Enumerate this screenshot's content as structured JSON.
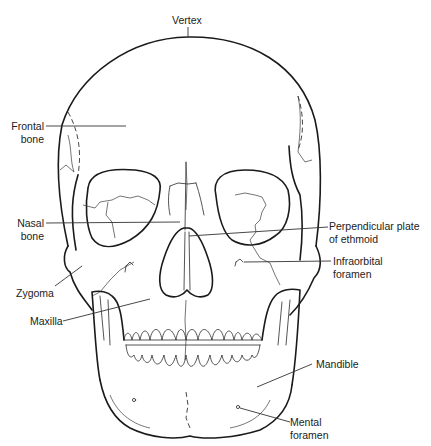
{
  "diagram": {
    "labels": {
      "vertex": {
        "line1": "Vertex"
      },
      "frontal_bone": {
        "line1": "Frontal",
        "line2": "bone"
      },
      "nasal_bone": {
        "line1": "Nasal",
        "line2": "bone"
      },
      "zygoma": {
        "line1": "Zygoma"
      },
      "maxilla": {
        "line1": "Maxilla"
      },
      "perpendicular_plate": {
        "line1": "Perpendicular plate",
        "line2": "of ethmoid"
      },
      "infraorbital_foramen": {
        "line1": "Infraorbital",
        "line2": "foramen"
      },
      "mandible": {
        "line1": "Mandible"
      },
      "mental_foramen": {
        "line1": "Mental",
        "line2": "foramen"
      }
    },
    "colors": {
      "line": "#1a1a1a",
      "text": "#222222",
      "background": "#ffffff"
    }
  }
}
